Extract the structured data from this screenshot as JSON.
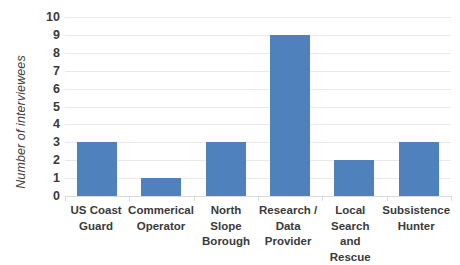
{
  "chart_data": {
    "type": "bar",
    "title": "",
    "subtitle": "",
    "xlabel": "",
    "ylabel": "Number of interviewees",
    "categories": [
      "US Coast Guard",
      "Commerical Operator",
      "North Slope Borough",
      "Research / Data Provider",
      "Local Search and Rescue",
      "Subsistence Hunter"
    ],
    "values": [
      3,
      1,
      3,
      9,
      2,
      3
    ],
    "ylim": [
      0,
      10
    ],
    "ytick_step": 1,
    "yticks": [
      "10",
      "9",
      "8",
      "7",
      "6",
      "5",
      "4",
      "3",
      "2",
      "1",
      "0"
    ],
    "grid": true,
    "grid_axis": "y",
    "legend": false,
    "legend_position": "none",
    "series": [
      {
        "name": "Number of interviewees",
        "values": [
          3,
          1,
          3,
          9,
          2,
          3
        ]
      }
    ]
  },
  "style": {
    "bar_color": "#4F81BD",
    "gridline_color": "#E9E9E9",
    "axis_color": "#D9D9D9",
    "text_color": "#3A3A3A",
    "axis_title_color": "#404040",
    "background": "#FFFFFF"
  }
}
